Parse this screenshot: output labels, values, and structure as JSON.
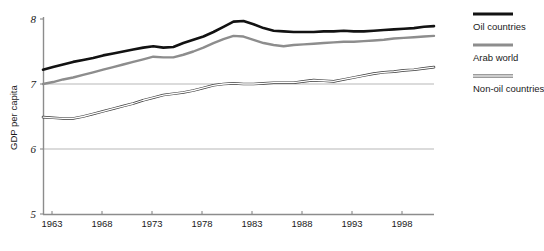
{
  "chart_data": {
    "type": "line",
    "title": "",
    "xlabel": "",
    "ylabel": "GDP per capita",
    "xlim": [
      1962,
      2001
    ],
    "ylim": [
      5,
      8
    ],
    "grid": "horizontal-at-6-and-7",
    "legend_position": "right",
    "x_ticks": [
      "1963",
      "1968",
      "1973",
      "1978",
      "1983",
      "1988",
      "1993",
      "1998"
    ],
    "y_ticks": [
      "5",
      "6",
      "7",
      "8"
    ],
    "x": [
      1962,
      1963,
      1964,
      1965,
      1966,
      1967,
      1968,
      1969,
      1970,
      1971,
      1972,
      1973,
      1974,
      1975,
      1976,
      1977,
      1978,
      1979,
      1980,
      1981,
      1982,
      1983,
      1984,
      1985,
      1986,
      1987,
      1988,
      1989,
      1990,
      1991,
      1992,
      1993,
      1994,
      1995,
      1996,
      1997,
      1998,
      1999,
      2000,
      2001
    ],
    "series": [
      {
        "name": "Oil countries",
        "color": "#121212",
        "style": "thick-solid",
        "values": [
          7.22,
          7.26,
          7.3,
          7.34,
          7.37,
          7.4,
          7.44,
          7.47,
          7.5,
          7.53,
          7.56,
          7.58,
          7.56,
          7.57,
          7.63,
          7.68,
          7.73,
          7.8,
          7.88,
          7.96,
          7.97,
          7.92,
          7.86,
          7.82,
          7.81,
          7.8,
          7.8,
          7.8,
          7.81,
          7.81,
          7.82,
          7.81,
          7.81,
          7.82,
          7.83,
          7.84,
          7.85,
          7.86,
          7.88,
          7.89
        ]
      },
      {
        "name": "Arab world",
        "color": "#8d8d8d",
        "style": "thick-solid",
        "values": [
          7.0,
          7.03,
          7.07,
          7.1,
          7.14,
          7.18,
          7.22,
          7.26,
          7.3,
          7.34,
          7.38,
          7.42,
          7.41,
          7.41,
          7.45,
          7.5,
          7.56,
          7.63,
          7.69,
          7.74,
          7.73,
          7.68,
          7.63,
          7.6,
          7.58,
          7.6,
          7.61,
          7.62,
          7.63,
          7.64,
          7.65,
          7.65,
          7.66,
          7.67,
          7.68,
          7.7,
          7.71,
          7.72,
          7.73,
          7.74
        ]
      },
      {
        "name": "Non-oil countries",
        "color": "#3a3a3a",
        "style": "thin-double",
        "values": [
          6.49,
          6.48,
          6.47,
          6.47,
          6.5,
          6.54,
          6.58,
          6.62,
          6.66,
          6.7,
          6.75,
          6.79,
          6.83,
          6.85,
          6.87,
          6.9,
          6.94,
          6.98,
          7.0,
          7.01,
          7.0,
          7.0,
          7.01,
          7.02,
          7.02,
          7.02,
          7.04,
          7.06,
          7.05,
          7.04,
          7.07,
          7.1,
          7.13,
          7.16,
          7.18,
          7.19,
          7.21,
          7.22,
          7.24,
          7.26
        ]
      }
    ]
  },
  "axis": {
    "y_label": "GDP per capita",
    "y_ticks": [
      "8",
      "7",
      "6",
      "5"
    ],
    "x_ticks": [
      "1963",
      "1968",
      "1973",
      "1978",
      "1983",
      "1988",
      "1993",
      "1998"
    ]
  },
  "legend": {
    "items": [
      {
        "label": "Oil countries",
        "swatch": "thick-black-line-swatch"
      },
      {
        "label": "Arab world",
        "swatch": "thick-gray-line-swatch"
      },
      {
        "label": "Non-oil countries",
        "swatch": "thin-double-line-swatch"
      }
    ]
  }
}
